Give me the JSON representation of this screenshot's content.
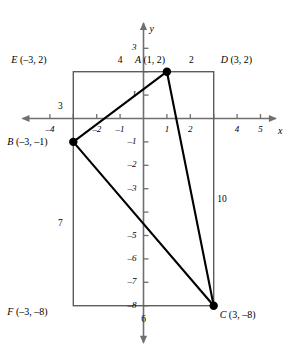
{
  "figure": {
    "axes": {
      "x_name": "x",
      "y_name": "y",
      "x_ticks": [
        {
          "value": -4,
          "label": "–4"
        },
        {
          "value": -3,
          "label": ""
        },
        {
          "value": -2,
          "label": "–2"
        },
        {
          "value": -1,
          "label": "–1"
        },
        {
          "value": 1,
          "label": "1"
        },
        {
          "value": 2,
          "label": "2"
        },
        {
          "value": 3,
          "label": ""
        },
        {
          "value": 4,
          "label": "4"
        },
        {
          "value": 5,
          "label": "5"
        }
      ],
      "y_ticks": [
        {
          "value": 3,
          "label": "3"
        },
        {
          "value": 2,
          "label": ""
        },
        {
          "value": 1,
          "label": "1"
        },
        {
          "value": -1,
          "label": "–1"
        },
        {
          "value": -2,
          "label": "–2"
        },
        {
          "value": -3,
          "label": "–3"
        },
        {
          "value": -4,
          "label": ""
        },
        {
          "value": -5,
          "label": "–5"
        },
        {
          "value": -6,
          "label": "–6"
        },
        {
          "value": -7,
          "label": "–7"
        },
        {
          "value": -8,
          "label": "–8"
        }
      ],
      "x_range": [
        -5,
        6
      ],
      "y_range": [
        -9.5,
        4
      ]
    },
    "points": [
      {
        "id": "A",
        "label": "A (1, 2)",
        "name": "A",
        "coords": "(1, 2)",
        "x": 1,
        "y": 2,
        "dot": true
      },
      {
        "id": "B",
        "label": "B (–3, –1)",
        "name": "B",
        "coords": "(–3, –1)",
        "x": -3,
        "y": -1,
        "dot": true
      },
      {
        "id": "C",
        "label": "C (3, –8)",
        "name": "C",
        "coords": "(3, –8)",
        "x": 3,
        "y": -8,
        "dot": true
      },
      {
        "id": "D",
        "label": "D (3, 2)",
        "name": "D",
        "coords": "(3, 2)",
        "x": 3,
        "y": 2,
        "dot": false
      },
      {
        "id": "E",
        "label": "E (–3, 2)",
        "name": "E",
        "coords": "(–3, 2)",
        "x": -3,
        "y": 2,
        "dot": false
      },
      {
        "id": "F",
        "label": "F (–3, –8)",
        "name": "F",
        "coords": "(–3, –8)",
        "x": -3,
        "y": -8,
        "dot": false
      }
    ],
    "triangle": {
      "vertices": [
        "A",
        "B",
        "C"
      ],
      "edges": [
        [
          "A",
          "B"
        ],
        [
          "B",
          "C"
        ],
        [
          "C",
          "A"
        ]
      ]
    },
    "rectangle": {
      "corners": [
        "E",
        "D",
        "C",
        "F"
      ],
      "left": -3,
      "right": 3,
      "top": 2,
      "bottom": -8
    },
    "side_labels": [
      {
        "id": "ea",
        "text": "4",
        "x": -1,
        "y": 2.45,
        "desc": "segment-EA-length"
      },
      {
        "id": "ad",
        "text": "2",
        "x": 2.05,
        "y": 2.45,
        "desc": "segment-AD-length"
      },
      {
        "id": "eb",
        "text": "3",
        "x": -3.55,
        "y": 0.5,
        "desc": "segment-EB-length"
      },
      {
        "id": "bf",
        "text": "7",
        "x": -3.55,
        "y": -4.5,
        "desc": "segment-BF-length"
      },
      {
        "id": "dc",
        "text": "10",
        "x": 3.35,
        "y": -3.5,
        "desc": "segment-DC-length"
      },
      {
        "id": "fc",
        "text": "6",
        "x": 0,
        "y": -8.6,
        "desc": "segment-FC-length"
      }
    ]
  }
}
